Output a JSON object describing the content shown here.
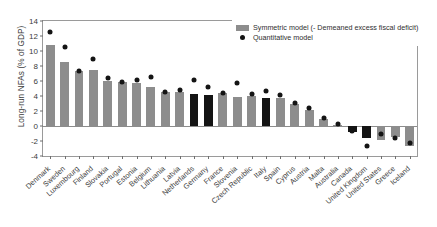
{
  "chart_data": {
    "type": "bar",
    "title": "",
    "xlabel": "",
    "ylabel": "Long-run NFAs (% of GDP)",
    "ylim": [
      -4,
      14
    ],
    "yticks": [
      -4,
      -2,
      0,
      2,
      4,
      6,
      8,
      10,
      12,
      14
    ],
    "grid": false,
    "legend_position": "top-right",
    "categories": [
      "Denmark",
      "Sweden",
      "Luxembourg",
      "Finland",
      "Slovakia",
      "Portugal",
      "Estonia",
      "Belgium",
      "Lithuania",
      "Latvia",
      "Netherlands",
      "Germany",
      "France",
      "Slovenia",
      "Czech Republic",
      "Italy",
      "Spain",
      "Cyprus",
      "Austria",
      "Malta",
      "Australia",
      "Canada",
      "United Kingdom",
      "United States",
      "Greece",
      "Iceland"
    ],
    "series": [
      {
        "name": "Symmetric model (- Demeaned excess fiscal deficit)",
        "type": "bar",
        "color": "#8d8d8d",
        "highlight_color": "#141414",
        "values": [
          10.8,
          8.5,
          7.4,
          7.5,
          6.0,
          5.9,
          5.8,
          5.2,
          4.5,
          4.5,
          4.3,
          4.1,
          4.4,
          3.9,
          4.0,
          3.7,
          3.8,
          2.9,
          2.2,
          0.9,
          0.2,
          -0.8,
          -1.6,
          -1.8,
          -1.4,
          -2.6
        ],
        "highlighted_categories": [
          "Netherlands",
          "Germany",
          "Italy",
          "Canada",
          "United Kingdom"
        ]
      },
      {
        "name": "Quantitative model",
        "type": "scatter",
        "color": "#141414",
        "values": [
          12.6,
          10.6,
          7.4,
          9.0,
          6.4,
          5.9,
          6.1,
          6.6,
          4.6,
          4.8,
          6.1,
          5.2,
          4.4,
          5.7,
          4.3,
          4.7,
          4.2,
          3.1,
          2.4,
          1.1,
          0.3,
          -0.7,
          -2.6,
          -1.0,
          -1.6,
          -2.2
        ]
      }
    ],
    "legend": [
      {
        "label": "Symmetric model (- Demeaned excess fiscal deficit)",
        "marker": "bar-swatch-icon"
      },
      {
        "label": "Quantitative model",
        "marker": "dot-marker-icon"
      }
    ]
  }
}
